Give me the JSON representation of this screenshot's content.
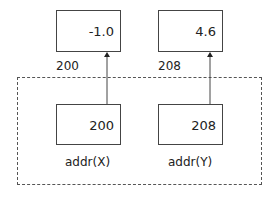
{
  "memory": [
    {
      "address": "200",
      "value": "-1.0"
    },
    {
      "address": "208",
      "value": "4.6"
    }
  ],
  "pointers": [
    {
      "label": "addr(X)",
      "value": "200"
    },
    {
      "label": "addr(Y)",
      "value": "208"
    }
  ]
}
